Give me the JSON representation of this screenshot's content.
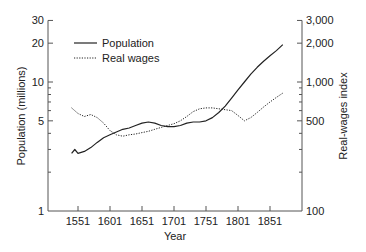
{
  "chart_data": {
    "type": "line",
    "title": "",
    "xlabel": "Year",
    "ylabel": "Population (millions)",
    "y2label": "Real-wages index",
    "x_ticks": [
      "1551",
      "1601",
      "1651",
      "1701",
      "1751",
      "1801",
      "1851"
    ],
    "y_ticks": [
      "1",
      "5",
      "10",
      "20",
      "30"
    ],
    "y2_ticks": [
      "100",
      "500",
      "1,000",
      "2,000",
      "3,000"
    ],
    "y_scale": "log",
    "ylim": [
      1,
      30
    ],
    "y2lim": [
      100,
      3000
    ],
    "xlim": [
      1541,
      1871
    ],
    "grid": false,
    "legend_position": "upper-left",
    "series": [
      {
        "name": "Population",
        "style": "solid",
        "axis": "left",
        "x": [
          1541,
          1546,
          1551,
          1561,
          1571,
          1581,
          1591,
          1601,
          1611,
          1621,
          1631,
          1641,
          1651,
          1661,
          1671,
          1681,
          1691,
          1701,
          1711,
          1721,
          1731,
          1741,
          1751,
          1761,
          1771,
          1781,
          1791,
          1801,
          1811,
          1821,
          1831,
          1841,
          1851,
          1861,
          1871
        ],
        "values": [
          2.8,
          3.0,
          2.8,
          2.9,
          3.1,
          3.4,
          3.7,
          3.9,
          4.1,
          4.3,
          4.4,
          4.6,
          4.8,
          4.9,
          4.8,
          4.6,
          4.5,
          4.5,
          4.6,
          4.8,
          4.9,
          4.9,
          5.0,
          5.3,
          5.8,
          6.5,
          7.5,
          8.7,
          10.0,
          11.5,
          13.0,
          14.5,
          16.0,
          17.5,
          19.5
        ]
      },
      {
        "name": "Real wages",
        "style": "dotted",
        "axis": "right",
        "x": [
          1541,
          1551,
          1561,
          1571,
          1581,
          1591,
          1601,
          1611,
          1621,
          1631,
          1641,
          1651,
          1661,
          1671,
          1681,
          1691,
          1701,
          1711,
          1721,
          1731,
          1741,
          1751,
          1761,
          1771,
          1781,
          1791,
          1801,
          1811,
          1821,
          1831,
          1841,
          1851,
          1861,
          1871
        ],
        "values": [
          630,
          570,
          540,
          560,
          530,
          480,
          420,
          390,
          380,
          390,
          395,
          405,
          415,
          430,
          445,
          460,
          475,
          500,
          540,
          590,
          620,
          630,
          630,
          620,
          610,
          600,
          550,
          500,
          530,
          580,
          640,
          700,
          760,
          820
        ]
      }
    ]
  },
  "legend": {
    "items": [
      {
        "label": "Population",
        "style": "solid"
      },
      {
        "label": "Real wages",
        "style": "dotted"
      }
    ]
  },
  "colors": {
    "line": "#222222",
    "axis": "#555555"
  }
}
